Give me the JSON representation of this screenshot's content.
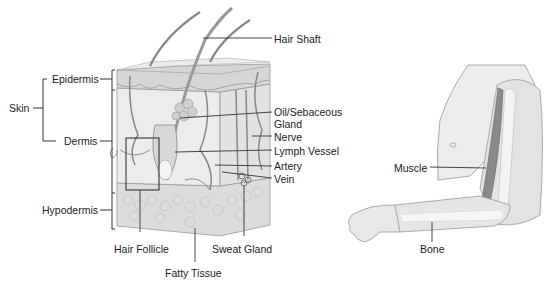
{
  "skin_diagram": {
    "group_label": "Skin",
    "layers": [
      "Epidermis",
      "Dermis",
      "Hypodermis"
    ],
    "right_labels": {
      "hair_shaft": "Hair Shaft",
      "oil_gland_line1": "Oil/Sebaceous",
      "oil_gland_line2": "Gland",
      "nerve": "Nerve",
      "lymph_vessel": "Lymph Vessel",
      "artery": "Artery",
      "vein": "Vein"
    },
    "bottom_labels": {
      "hair_follicle": "Hair Follicle",
      "fatty_tissue": "Fatty Tissue",
      "sweat_gland": "Sweat Gland"
    }
  },
  "arm_diagram": {
    "muscle": "Muscle",
    "bone": "Bone"
  },
  "colors": {
    "line": "#333333",
    "skin_light": "#e6e6e6",
    "skin_mid": "#cfcfcf",
    "muscle": "#8a8a8a",
    "fat": "#d9d9d9"
  }
}
